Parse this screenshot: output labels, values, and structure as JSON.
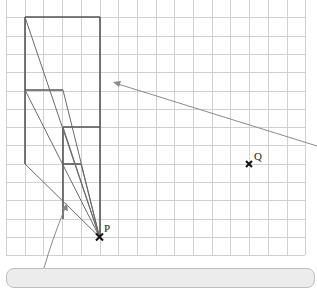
{
  "diagram": {
    "type": "enlargement-construction-on-grid",
    "grid": {
      "origin_x": 6,
      "origin_y": -1,
      "cell_w": 18.7,
      "cell_h": 18.3,
      "cols": 16,
      "rows": 14,
      "line_color": "#d0d0d0"
    },
    "points": [
      {
        "name": "P",
        "label": "P",
        "x": 99.5,
        "y": 237
      },
      {
        "name": "Q",
        "label": "Q",
        "x": 249,
        "y": 164
      }
    ],
    "shapes": {
      "large_shape": "Large L-shaped figure with top edge from (25,17) to (100,17)",
      "middle_shape": "Medium figure with top edge from (25,90) to (63,90)",
      "small_shape": "Small figure with top edge from (63,127) to (100,127)"
    },
    "colors": {
      "shape_stroke": "#555555",
      "ray_stroke": "#6a6a6a",
      "arrow_stroke": "#8a8a8a",
      "cross": "#111111",
      "callout_fill": "#ececec"
    }
  },
  "callout": {
    "text": ""
  }
}
